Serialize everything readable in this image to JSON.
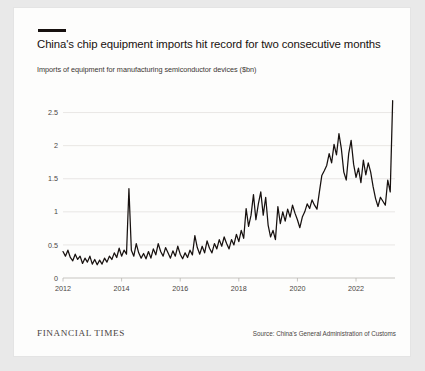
{
  "card": {
    "title": "China's chip equipment imports hit record for two consecutive months",
    "subtitle": "Imports of equipment for manufacturing semiconductor devices ($bn)",
    "brand": "FINANCIAL TIMES",
    "source": "Source: China's General Administration of Customs"
  },
  "chart_data": {
    "type": "line",
    "title": "China's chip equipment imports hit record for two consecutive months",
    "subtitle": "Imports of equipment for manufacturing semiconductor devices ($bn)",
    "xlabel": "",
    "ylabel": "$bn",
    "xlim": [
      2012.0,
      2023.33
    ],
    "ylim": [
      0,
      2.75
    ],
    "ytick_labels": [
      "0",
      "0.5",
      "1",
      "1.5",
      "2",
      "2.5"
    ],
    "ytick_values": [
      0,
      0.5,
      1,
      1.5,
      2,
      2.5
    ],
    "xtick_labels": [
      "2012",
      "2014",
      "2016",
      "2018",
      "2020",
      "2022"
    ],
    "xtick_values": [
      2012,
      2014,
      2016,
      2018,
      2020,
      2022
    ],
    "grid": true,
    "legend": false,
    "line_color": "#17110f",
    "series": [
      {
        "name": "Imports of semiconductor manufacturing equipment ($bn)",
        "x": [
          2012.0,
          2012.083,
          2012.167,
          2012.25,
          2012.333,
          2012.417,
          2012.5,
          2012.583,
          2012.667,
          2012.75,
          2012.833,
          2012.917,
          2013.0,
          2013.083,
          2013.167,
          2013.25,
          2013.333,
          2013.417,
          2013.5,
          2013.583,
          2013.667,
          2013.75,
          2013.833,
          2013.917,
          2014.0,
          2014.083,
          2014.167,
          2014.25,
          2014.333,
          2014.417,
          2014.5,
          2014.583,
          2014.667,
          2014.75,
          2014.833,
          2014.917,
          2015.0,
          2015.083,
          2015.167,
          2015.25,
          2015.333,
          2015.417,
          2015.5,
          2015.583,
          2015.667,
          2015.75,
          2015.833,
          2015.917,
          2016.0,
          2016.083,
          2016.167,
          2016.25,
          2016.333,
          2016.417,
          2016.5,
          2016.583,
          2016.667,
          2016.75,
          2016.833,
          2016.917,
          2017.0,
          2017.083,
          2017.167,
          2017.25,
          2017.333,
          2017.417,
          2017.5,
          2017.583,
          2017.667,
          2017.75,
          2017.833,
          2017.917,
          2018.0,
          2018.083,
          2018.167,
          2018.25,
          2018.333,
          2018.417,
          2018.5,
          2018.583,
          2018.667,
          2018.75,
          2018.833,
          2018.917,
          2019.0,
          2019.083,
          2019.167,
          2019.25,
          2019.333,
          2019.417,
          2019.5,
          2019.583,
          2019.667,
          2019.75,
          2019.833,
          2019.917,
          2020.0,
          2020.083,
          2020.167,
          2020.25,
          2020.333,
          2020.417,
          2020.5,
          2020.583,
          2020.667,
          2020.75,
          2020.833,
          2020.917,
          2021.0,
          2021.083,
          2021.167,
          2021.25,
          2021.333,
          2021.417,
          2021.5,
          2021.583,
          2021.667,
          2021.75,
          2021.833,
          2021.917,
          2022.0,
          2022.083,
          2022.167,
          2022.25,
          2022.333,
          2022.417,
          2022.5,
          2022.583,
          2022.667,
          2022.75,
          2022.833,
          2022.917,
          2023.0,
          2023.083,
          2023.167,
          2023.25
        ],
        "values": [
          0.4,
          0.33,
          0.42,
          0.31,
          0.26,
          0.36,
          0.28,
          0.33,
          0.22,
          0.3,
          0.24,
          0.33,
          0.21,
          0.28,
          0.2,
          0.27,
          0.21,
          0.3,
          0.24,
          0.33,
          0.28,
          0.38,
          0.31,
          0.45,
          0.33,
          0.42,
          0.36,
          1.35,
          0.42,
          0.33,
          0.52,
          0.38,
          0.3,
          0.37,
          0.29,
          0.4,
          0.3,
          0.44,
          0.35,
          0.52,
          0.4,
          0.33,
          0.46,
          0.38,
          0.3,
          0.41,
          0.33,
          0.48,
          0.36,
          0.29,
          0.38,
          0.31,
          0.42,
          0.35,
          0.64,
          0.46,
          0.36,
          0.48,
          0.38,
          0.56,
          0.45,
          0.38,
          0.52,
          0.44,
          0.58,
          0.48,
          0.62,
          0.52,
          0.44,
          0.58,
          0.5,
          0.66,
          0.55,
          0.72,
          0.6,
          1.05,
          0.78,
          0.95,
          1.26,
          0.88,
          1.12,
          1.3,
          0.95,
          1.22,
          0.8,
          0.62,
          0.72,
          0.58,
          1.08,
          0.82,
          1.0,
          0.86,
          1.04,
          0.92,
          1.1,
          0.98,
          0.88,
          0.76,
          0.92,
          1.0,
          1.12,
          1.05,
          1.18,
          1.1,
          1.04,
          1.3,
          1.55,
          1.62,
          1.7,
          1.88,
          1.74,
          2.02,
          1.86,
          2.18,
          1.95,
          1.6,
          1.48,
          1.88,
          2.08,
          1.72,
          1.52,
          1.66,
          1.44,
          1.78,
          1.56,
          1.74,
          1.6,
          1.38,
          1.2,
          1.08,
          1.22,
          1.16,
          1.1,
          1.48,
          1.3,
          2.68
        ]
      }
    ],
    "annotations": [
      {
        "label": "2013 one-off spike",
        "x": 2014.25,
        "y": 1.35
      },
      {
        "label": "record high",
        "x": 2023.25,
        "y": 2.68
      }
    ]
  }
}
